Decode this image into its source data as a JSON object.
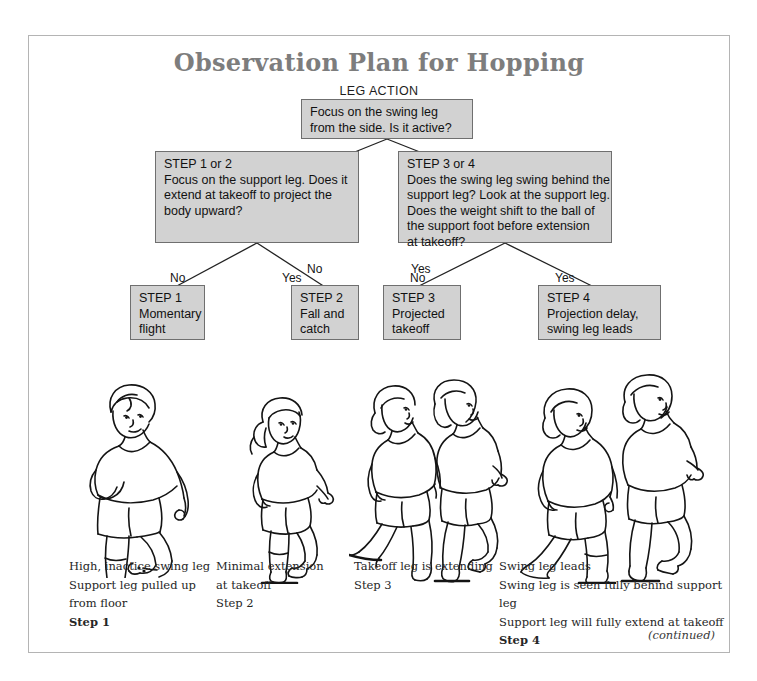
{
  "page": {
    "title": "Observation Plan for Hopping",
    "subhead": "LEG ACTION",
    "continued": "(continued)"
  },
  "flowchart": {
    "root": {
      "line1": "Focus on the swing leg",
      "line2": "from the side. Is it active?"
    },
    "left_branch": {
      "line1": "STEP 1 or 2",
      "line2": "Focus on the support leg. Does it",
      "line3": "extend at takeoff to project the",
      "line4": "body upward?"
    },
    "right_branch": {
      "line1": "STEP 3 or 4",
      "line2": "Does the swing leg swing behind the",
      "line3": "support leg? Look at the support leg.",
      "line4": "Does the weight shift to the ball of",
      "line5": "the support foot before extension",
      "line6": "at takeoff?"
    },
    "steps": {
      "step1": {
        "line1": "STEP 1",
        "line2": "Momentary",
        "line3": "flight"
      },
      "step2": {
        "line1": "STEP 2",
        "line2": "Fall and",
        "line3": "catch"
      },
      "step3": {
        "line1": "STEP 3",
        "line2": "Projected",
        "line3": "takeoff"
      },
      "step4": {
        "line1": "STEP 4",
        "line2": "Projection delay,",
        "line3": "swing leg leads"
      }
    },
    "edge_labels": {
      "root_no": "No",
      "root_yes": "Yes",
      "left_no": "No",
      "left_yes": "Yes",
      "right_no": "No",
      "right_yes": "Yes"
    }
  },
  "captions": [
    {
      "lines": [
        "High, inactice swing leg",
        "Support leg pulled up",
        "from floor"
      ],
      "step": "Step 1"
    },
    {
      "lines": [
        "Minimal extension",
        "at takeoff"
      ],
      "step": "Step 2"
    },
    {
      "lines": [
        "Takeoff leg is extending"
      ],
      "step": "Step 3"
    },
    {
      "lines": [
        "Swing leg leads",
        "Swing leg is seen fully behind support leg",
        "Support leg will fully extend at takeoff"
      ],
      "step": "Step 4"
    }
  ],
  "colors": {
    "box_fill": "#d2d2d2",
    "box_border": "#6f6f6f",
    "title_color": "#7d7d7d",
    "page_border": "#b4b4b4",
    "ink": "#141414"
  }
}
